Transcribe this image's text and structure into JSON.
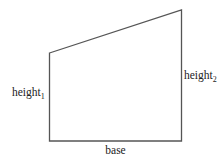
{
  "diagram": {
    "type": "trapezoid",
    "stroke_color": "#555555",
    "text_color": "#222222",
    "vertices": {
      "top_left": [
        49.5,
        53
      ],
      "top_right": [
        181.5,
        10
      ],
      "bottom_right": [
        181.5,
        141
      ],
      "bottom_left": [
        49.5,
        141
      ]
    },
    "labels": {
      "left_side": {
        "base_text": "height",
        "subscript": "1"
      },
      "right_side": {
        "base_text": "height",
        "subscript": "2"
      },
      "bottom_side": {
        "text": "base"
      }
    }
  }
}
